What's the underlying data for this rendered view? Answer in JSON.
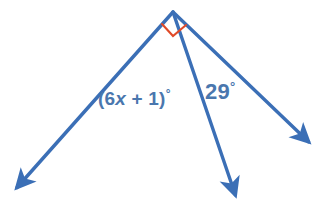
{
  "figure": {
    "type": "geometry-angle-diagram",
    "background_color": "#ffffff",
    "ray_color": "#3b6fb6",
    "mark_color": "#e04a28",
    "text_color": "#4a77ae",
    "vertex": {
      "x": 173,
      "y": 12
    },
    "rays": [
      {
        "name": "left-ray",
        "from": [
          173,
          12
        ],
        "to": [
          13,
          192
        ],
        "arrowhead": true
      },
      {
        "name": "middle-ray",
        "from": [
          173,
          12
        ],
        "to": [
          237,
          200
        ],
        "arrowhead": true
      },
      {
        "name": "right-ray",
        "from": [
          173,
          12
        ],
        "to": [
          313,
          146
        ],
        "arrowhead": true
      }
    ],
    "angle_marks": [
      {
        "name": "right-angle-square",
        "color": "#e04a28",
        "points": [
          [
            162,
            24
          ],
          [
            173,
            36
          ],
          [
            186,
            25
          ]
        ]
      }
    ]
  },
  "labels": {
    "expression": {
      "full": "(6x + 1)°",
      "prefix": "(6",
      "variable": "x",
      "suffix": " + 1)",
      "degree": "°"
    },
    "angle_29": {
      "full": "29°",
      "value": "29",
      "degree": "°"
    }
  }
}
